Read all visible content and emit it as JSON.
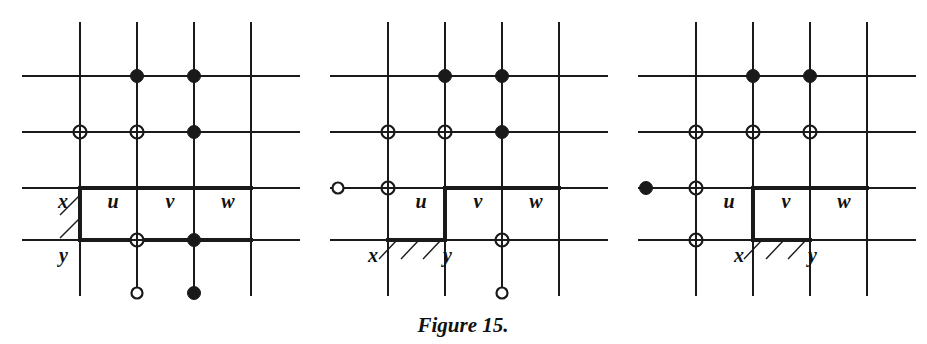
{
  "figure": {
    "caption": "Figure 15.",
    "caption_x": 463,
    "caption_y": 332,
    "background_color": "#ffffff",
    "line_color": "#1a1a1a",
    "grid_line_width": 2.0,
    "thick_line_width": 4.0,
    "marker_radius": 6.5,
    "hollow_end_radius": 5.5,
    "stub_length": 28,
    "panels": [
      {
        "name": "panel-1",
        "index": 1,
        "col_x": [
          80,
          137,
          194,
          251
        ],
        "row_y": [
          76,
          132,
          188,
          240
        ],
        "grid_x_min": 22,
        "grid_x_max": 300,
        "grid_y_min": 22,
        "grid_y_max": 296,
        "labels": [
          {
            "text": "x",
            "x": 68,
            "y": 208,
            "anchor": "end",
            "name": "label-x"
          },
          {
            "text": "y",
            "x": 68,
            "y": 262,
            "anchor": "end",
            "name": "label-y"
          },
          {
            "text": "u",
            "x": 113,
            "y": 208,
            "anchor": "middle",
            "name": "label-u"
          },
          {
            "text": "v",
            "x": 170,
            "y": 208,
            "anchor": "middle",
            "name": "label-v"
          },
          {
            "text": "w",
            "x": 228,
            "y": 208,
            "anchor": "middle",
            "name": "label-w"
          }
        ],
        "thick_segments": [
          {
            "orientation": "vertical",
            "x1": 80,
            "y1": 188,
            "x2": 80,
            "y2": 240,
            "name": "boundary-edge-xy"
          },
          {
            "orientation": "horizontal",
            "x1": 80,
            "y1": 188,
            "x2": 251,
            "y2": 188,
            "name": "boundary-edge-top"
          },
          {
            "orientation": "horizontal",
            "x1": 80,
            "y1": 240,
            "x2": 251,
            "y2": 240,
            "name": "boundary-edge-bottom"
          }
        ],
        "hatches": [
          {
            "x1": 80,
            "y1": 195,
            "x2": 60,
            "y2": 215
          },
          {
            "x1": 80,
            "y1": 218,
            "x2": 60,
            "y2": 238
          }
        ],
        "markers": [
          {
            "kind": "filled",
            "cx": 137,
            "cy": 76,
            "name": "marker-filled"
          },
          {
            "kind": "filled",
            "cx": 194,
            "cy": 76,
            "name": "marker-filled"
          },
          {
            "kind": "crossed",
            "cx": 80,
            "cy": 132,
            "name": "marker-crossed"
          },
          {
            "kind": "crossed",
            "cx": 137,
            "cy": 132,
            "name": "marker-crossed"
          },
          {
            "kind": "filled",
            "cx": 194,
            "cy": 132,
            "name": "marker-filled"
          },
          {
            "kind": "crossed",
            "cx": 137,
            "cy": 240,
            "name": "marker-crossed"
          },
          {
            "kind": "filled",
            "cx": 194,
            "cy": 240,
            "name": "marker-filled"
          },
          {
            "kind": "hollow",
            "cx": 137,
            "cy": 293,
            "name": "marker-hollow-terminal"
          },
          {
            "kind": "filled",
            "cx": 194,
            "cy": 293,
            "name": "marker-filled-terminal"
          }
        ],
        "stubs": [
          {
            "x1": 137,
            "y1": 240,
            "x2": 137,
            "y2": 293,
            "name": "stub-u-down"
          },
          {
            "x1": 194,
            "y1": 240,
            "x2": 194,
            "y2": 293,
            "name": "stub-v-down"
          }
        ]
      },
      {
        "name": "panel-2",
        "index": 2,
        "col_x": [
          388,
          445,
          502,
          559
        ],
        "row_y": [
          76,
          132,
          188,
          240
        ],
        "grid_x_min": 330,
        "grid_x_max": 608,
        "grid_y_min": 22,
        "grid_y_max": 296,
        "labels": [
          {
            "text": "u",
            "x": 421,
            "y": 208,
            "anchor": "middle",
            "name": "label-u"
          },
          {
            "text": "v",
            "x": 478,
            "y": 208,
            "anchor": "middle",
            "name": "label-v"
          },
          {
            "text": "w",
            "x": 536,
            "y": 208,
            "anchor": "middle",
            "name": "label-w"
          },
          {
            "text": "x",
            "x": 378,
            "y": 262,
            "anchor": "end",
            "name": "label-x"
          },
          {
            "text": "y",
            "x": 452,
            "y": 262,
            "anchor": "end",
            "name": "label-y"
          }
        ],
        "thick_segments": [
          {
            "orientation": "horizontal",
            "x1": 388,
            "y1": 240,
            "x2": 445,
            "y2": 240,
            "name": "boundary-edge-xy"
          },
          {
            "orientation": "vertical",
            "x1": 445,
            "y1": 188,
            "x2": 445,
            "y2": 240,
            "name": "boundary-edge-left"
          },
          {
            "orientation": "horizontal",
            "x1": 445,
            "y1": 188,
            "x2": 559,
            "y2": 188,
            "name": "boundary-edge-top"
          }
        ],
        "hatches": [
          {
            "x1": 397,
            "y1": 240,
            "x2": 379,
            "y2": 259
          },
          {
            "x1": 419,
            "y1": 240,
            "x2": 401,
            "y2": 259
          },
          {
            "x1": 441,
            "y1": 240,
            "x2": 423,
            "y2": 259
          }
        ],
        "markers": [
          {
            "kind": "filled",
            "cx": 445,
            "cy": 76,
            "name": "marker-filled"
          },
          {
            "kind": "filled",
            "cx": 502,
            "cy": 76,
            "name": "marker-filled"
          },
          {
            "kind": "crossed",
            "cx": 388,
            "cy": 132,
            "name": "marker-crossed"
          },
          {
            "kind": "crossed",
            "cx": 445,
            "cy": 132,
            "name": "marker-crossed"
          },
          {
            "kind": "filled",
            "cx": 502,
            "cy": 132,
            "name": "marker-filled"
          },
          {
            "kind": "crossed",
            "cx": 388,
            "cy": 188,
            "name": "marker-crossed"
          },
          {
            "kind": "hollow",
            "cx": 338,
            "cy": 188,
            "name": "marker-hollow-terminal"
          },
          {
            "kind": "crossed",
            "cx": 502,
            "cy": 240,
            "name": "marker-crossed"
          },
          {
            "kind": "hollow",
            "cx": 502,
            "cy": 293,
            "name": "marker-hollow-terminal"
          }
        ],
        "stubs": [
          {
            "x1": 502,
            "y1": 240,
            "x2": 502,
            "y2": 293,
            "name": "stub-v-down"
          },
          {
            "x1": 338,
            "y1": 188,
            "x2": 388,
            "y2": 188,
            "name": "stub-left"
          }
        ]
      },
      {
        "name": "panel-3",
        "index": 3,
        "col_x": [
          696,
          753,
          810,
          867
        ],
        "row_y": [
          76,
          132,
          188,
          240
        ],
        "grid_x_min": 638,
        "grid_x_max": 916,
        "grid_y_min": 22,
        "grid_y_max": 296,
        "labels": [
          {
            "text": "u",
            "x": 729,
            "y": 208,
            "anchor": "middle",
            "name": "label-u"
          },
          {
            "text": "v",
            "x": 786,
            "y": 208,
            "anchor": "middle",
            "name": "label-v"
          },
          {
            "text": "w",
            "x": 844,
            "y": 208,
            "anchor": "middle",
            "name": "label-w"
          },
          {
            "text": "x",
            "x": 744,
            "y": 262,
            "anchor": "end",
            "name": "label-x"
          },
          {
            "text": "y",
            "x": 817,
            "y": 262,
            "anchor": "end",
            "name": "label-y"
          }
        ],
        "thick_segments": [
          {
            "orientation": "horizontal",
            "x1": 753,
            "y1": 240,
            "x2": 810,
            "y2": 240,
            "name": "boundary-edge-xy"
          },
          {
            "orientation": "vertical",
            "x1": 753,
            "y1": 188,
            "x2": 753,
            "y2": 240,
            "name": "boundary-edge-left"
          },
          {
            "orientation": "horizontal",
            "x1": 753,
            "y1": 188,
            "x2": 867,
            "y2": 188,
            "name": "boundary-edge-top"
          }
        ],
        "hatches": [
          {
            "x1": 762,
            "y1": 240,
            "x2": 744,
            "y2": 259
          },
          {
            "x1": 784,
            "y1": 240,
            "x2": 766,
            "y2": 259
          },
          {
            "x1": 806,
            "y1": 240,
            "x2": 788,
            "y2": 259
          }
        ],
        "markers": [
          {
            "kind": "filled",
            "cx": 753,
            "cy": 76,
            "name": "marker-filled"
          },
          {
            "kind": "filled",
            "cx": 810,
            "cy": 76,
            "name": "marker-filled"
          },
          {
            "kind": "crossed",
            "cx": 696,
            "cy": 132,
            "name": "marker-crossed"
          },
          {
            "kind": "crossed",
            "cx": 753,
            "cy": 132,
            "name": "marker-crossed"
          },
          {
            "kind": "crossed",
            "cx": 810,
            "cy": 132,
            "name": "marker-crossed"
          },
          {
            "kind": "crossed",
            "cx": 696,
            "cy": 188,
            "name": "marker-crossed"
          },
          {
            "kind": "filled",
            "cx": 646,
            "cy": 188,
            "name": "marker-filled-terminal"
          },
          {
            "kind": "crossed",
            "cx": 696,
            "cy": 240,
            "name": "marker-crossed"
          }
        ],
        "stubs": [
          {
            "x1": 646,
            "y1": 188,
            "x2": 696,
            "y2": 188,
            "name": "stub-left"
          }
        ]
      }
    ]
  }
}
